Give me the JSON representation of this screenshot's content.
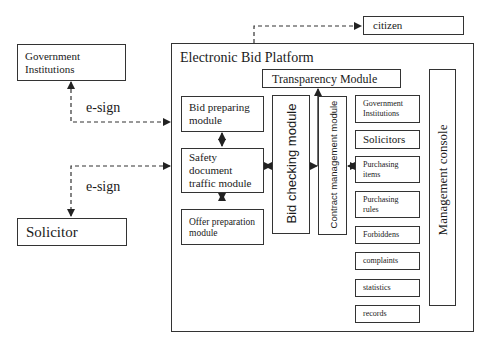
{
  "external": {
    "government_institutions": "Government\nInstitutions",
    "solicitor": "Solicitor",
    "citizen": "citizen",
    "esign_top": "e-sign",
    "esign_bottom": "e-sign"
  },
  "platform": {
    "title": "Electronic Bid Platform",
    "transparency_module": "Transparency Module",
    "bid_preparing_module": "Bid preparing\nmodule",
    "safety_document_module": "Safety\ndocument\ntraffic module",
    "offer_preparation_module": "Offer preparation\nmodule",
    "bid_checking_module": "Bid checking module",
    "contract_management_module": "Contract management module",
    "management_console": "Management  console",
    "data_items": [
      "Government\nInstitutions",
      "Solicitors",
      "Purchasing\nitems",
      "Purchasing\nrules",
      "Forbiddens",
      "complaints",
      "statistics",
      "records"
    ]
  },
  "colors": {
    "line": "#333333",
    "background": "#ffffff"
  }
}
